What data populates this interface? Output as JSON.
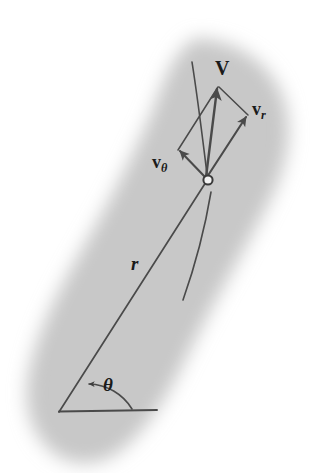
{
  "figure": {
    "name": "polar-velocity-components",
    "width": 317,
    "height": 473,
    "background_color": "#ffffff",
    "page_shadow_color": "#c9c9c9",
    "ink_color": "#4a4a4a",
    "text_color": "#1a1a1a"
  },
  "labels": {
    "velocity_total": "V",
    "velocity_radial_base": "v",
    "velocity_radial_sub": "r",
    "velocity_angular_base": "v",
    "velocity_angular_sub": "θ",
    "radius": "r",
    "angle": "θ"
  },
  "geometry": {
    "origin": {
      "x": 59,
      "y": 412
    },
    "particle": {
      "x": 208,
      "y": 180
    },
    "baseline_end": {
      "x": 157,
      "y": 410
    },
    "radius_line_length_px": 275,
    "angle_theta_degrees": 57,
    "angle_arc_radius_px": 52,
    "particle_radius_px": 5,
    "vectors": [
      {
        "name": "V",
        "tip": {
          "x": 218,
          "y": 86
        },
        "length_px": 94,
        "bearing_degrees": 78
      },
      {
        "name": "v_r",
        "tip": {
          "x": 248,
          "y": 115
        },
        "length_px": 76,
        "bearing_degrees": 58
      },
      {
        "name": "v_theta",
        "tip": {
          "x": 178,
          "y": 150
        },
        "length_px": 42,
        "bearing_degrees": 135
      }
    ],
    "parallelogram_corners": [
      {
        "x": 208,
        "y": 180
      },
      {
        "x": 248,
        "y": 115
      },
      {
        "x": 218,
        "y": 86
      },
      {
        "x": 178,
        "y": 150
      }
    ],
    "trajectory_upper": {
      "start": {
        "x": 192,
        "y": 62
      },
      "end": {
        "x": 208,
        "y": 180
      }
    },
    "trajectory_lower": {
      "start": {
        "x": 210,
        "y": 190
      },
      "end": {
        "x": 183,
        "y": 300
      }
    }
  }
}
